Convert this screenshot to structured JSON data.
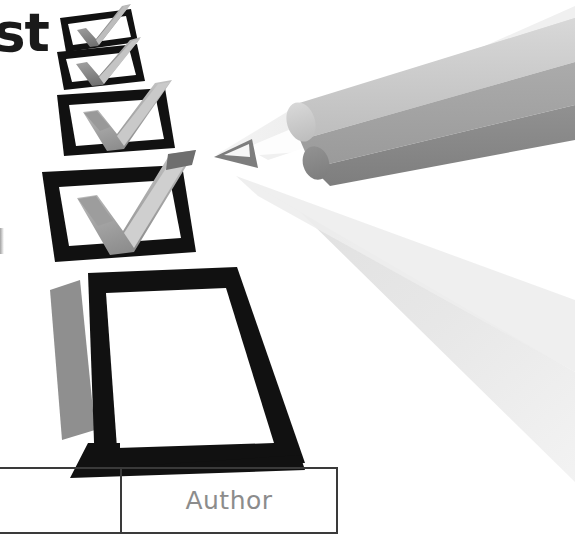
{
  "page": {
    "width": 575,
    "height": 544,
    "background": "#ffffff",
    "kind": "scanned-book-page-illustration"
  },
  "title": {
    "fragment_text": "st",
    "note": "truncated word fragment at page left edge",
    "color": "#1a1a1a"
  },
  "illustration": {
    "name": "checklist-and-pencil",
    "pencil": {
      "label": "pencil-icon",
      "direction": "pointing-left",
      "colors": {
        "barrel_top": "#c9c9c9",
        "barrel_middle": "#a0a0a0",
        "barrel_bottom": "#8a8a8a",
        "wood_cone": "#e3e3e3",
        "graphite_tip": "#7a7a7a",
        "shadow": "#e8e8e8"
      }
    },
    "checkboxes": [
      {
        "name": "checkbox-1",
        "state": "checked",
        "size": "small"
      },
      {
        "name": "checkbox-2",
        "state": "checked",
        "size": "small"
      },
      {
        "name": "checkbox-3",
        "state": "checked",
        "size": "medium"
      },
      {
        "name": "checkbox-4",
        "state": "checked",
        "size": "large"
      },
      {
        "name": "checkbox-5",
        "state": "unchecked",
        "size": "extra-large"
      }
    ],
    "colors": {
      "box_border": "#111111",
      "box_fill": "#ffffff",
      "check_light": "#d2d2d2",
      "check_mid": "#a8a8a8",
      "check_dark": "#7d7d7d",
      "box_shadow": "#9a9a9a"
    }
  },
  "table": {
    "name": "author-table",
    "border_color": "#3a3a3a",
    "text_color": "#8c8c8c",
    "columns": [
      "",
      "Author"
    ],
    "rows": [
      {
        "cells": [
          "",
          "Author"
        ]
      }
    ]
  }
}
